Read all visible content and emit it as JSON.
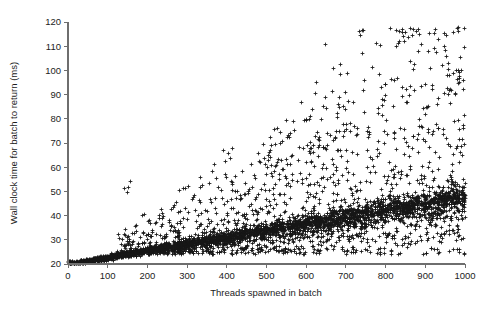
{
  "chart_data": {
    "type": "scatter",
    "title": "",
    "xlabel": "Threads spawned in batch",
    "ylabel": "Wall clock time for batch to return (ms)",
    "xlim": [
      0,
      1000
    ],
    "ylim": [
      20,
      120
    ],
    "xticks": [
      0,
      100,
      200,
      300,
      400,
      500,
      600,
      700,
      800,
      900,
      1000
    ],
    "yticks": [
      20,
      30,
      40,
      50,
      60,
      70,
      80,
      90,
      100,
      110,
      120
    ],
    "grid": false,
    "legend": null,
    "marker": "plus",
    "marker_color": "#171717",
    "axis_color": "#6e6e6e",
    "series": [
      {
        "name": "batch wall clock time",
        "description": "Dense main band rising roughly linearly from 20 ms at 0 threads to about 48 ms at 1000 threads, with an increasing cloud of scatter above and below the band and sparse high outliers reaching 112 ms.",
        "trend": {
          "intercept_ms": 20.0,
          "slope_ms_per_thread": 0.028,
          "band_half_width_ms_at_0": 0.6,
          "band_half_width_ms_at_1000": 6.5
        },
        "noise": {
          "upper_tail_fraction": 0.18,
          "upper_tail_max_ms": 112,
          "lower_tail_fraction": 0.16,
          "lower_tail_min_ms": 24
        },
        "n_points": 4200,
        "notable_outliers": [
          {
            "x": 150,
            "y": 52
          },
          {
            "x": 402,
            "y": 66
          },
          {
            "x": 505,
            "y": 63
          },
          {
            "x": 560,
            "y": 74
          },
          {
            "x": 600,
            "y": 80
          },
          {
            "x": 612,
            "y": 68
          },
          {
            "x": 700,
            "y": 78
          },
          {
            "x": 790,
            "y": 88
          },
          {
            "x": 820,
            "y": 96
          },
          {
            "x": 835,
            "y": 112
          },
          {
            "x": 860,
            "y": 90
          },
          {
            "x": 905,
            "y": 85
          },
          {
            "x": 960,
            "y": 92
          },
          {
            "x": 985,
            "y": 97
          },
          {
            "x": 995,
            "y": 96
          }
        ]
      }
    ]
  },
  "figure": {
    "background": "#ffffff",
    "plot_area": {
      "left_px": 68,
      "right_px": 465,
      "top_px": 22,
      "bottom_px": 264
    }
  }
}
